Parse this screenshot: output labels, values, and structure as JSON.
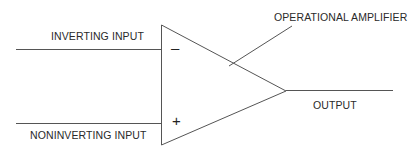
{
  "diagram": {
    "labels": {
      "inverting_input": "INVERTING INPUT",
      "noninverting_input": "NONINVERTING INPUT",
      "operational_amplifier": "OPERATIONAL AMPLIFIER",
      "output": "OUTPUT"
    },
    "signs": {
      "minus": "–",
      "plus": "+"
    },
    "colors": {
      "line": "#555555",
      "text": "#2a2a2a"
    }
  }
}
